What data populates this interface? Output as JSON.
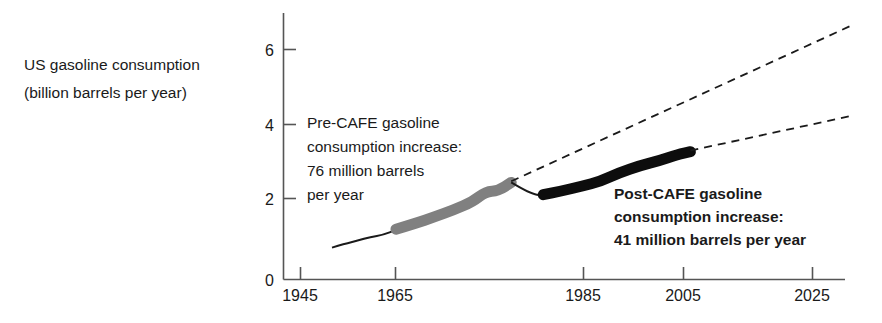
{
  "chart_data": {
    "type": "line",
    "title": "",
    "ylabel_lines": [
      "US gasoline consumption",
      "(billion barrels per year)"
    ],
    "ylabel": "US gasoline consumption (billion barrels per year)",
    "xlabel": "",
    "xlim": [
      1941,
      2033
    ],
    "ylim": [
      0,
      6.8
    ],
    "grid": false,
    "legend_position": "none",
    "x_ticks": [
      1945,
      1965,
      1985,
      2005,
      2025
    ],
    "y_ticks": [
      0,
      2,
      4,
      6
    ],
    "units": {
      "y": "billion barrels per year",
      "x": "year"
    },
    "series": [
      {
        "name": "Historical consumption (thin, pre-1954)",
        "style": "solid-thin",
        "color": "#1a1a1a",
        "x": [
          1950,
          1952,
          1954,
          1956,
          1958,
          1960
        ],
        "values": [
          0.82,
          0.92,
          1.0,
          1.1,
          1.15,
          1.28
        ]
      },
      {
        "name": "Pre-CAFE consumption trend (thick grey)",
        "style": "solid-thick",
        "color": "#808080",
        "x": [
          1960,
          1963,
          1966,
          1969,
          1972,
          1974,
          1976,
          1978
        ],
        "values": [
          1.3,
          1.45,
          1.62,
          1.8,
          2.02,
          2.28,
          2.3,
          2.52
        ]
      },
      {
        "name": "Transition dip 1978-1983",
        "style": "solid-thin",
        "color": "#1a1a1a",
        "x": [
          1978,
          1981,
          1983
        ],
        "values": [
          2.52,
          2.22,
          2.18
        ]
      },
      {
        "name": "Post-CAFE consumption trend (thick black)",
        "style": "solid-thick",
        "color": "#0d0d0d",
        "x": [
          1983,
          1986,
          1989,
          1992,
          1995,
          1998,
          2001,
          2004,
          2006
        ],
        "values": [
          2.2,
          2.3,
          2.42,
          2.55,
          2.78,
          2.95,
          3.08,
          3.25,
          3.32
        ]
      },
      {
        "name": "Pre-CAFE extrapolation (dashed)",
        "style": "dashed",
        "color": "#1a1a1a",
        "x": [
          1978,
          2031
        ],
        "values": [
          2.55,
          6.6
        ]
      },
      {
        "name": "Post-CAFE extrapolation (dashed)",
        "style": "dashed",
        "color": "#1a1a1a",
        "x": [
          2006,
          2031
        ],
        "values": [
          3.35,
          4.25
        ]
      }
    ],
    "annotations": [
      {
        "name": "pre-cafe-annotation",
        "weight": "regular",
        "lines": [
          "Pre-CAFE gasoline",
          "consumption increase:",
          "76 million barrels",
          "per year"
        ],
        "rate_value": 76,
        "rate_units": "million barrels per year"
      },
      {
        "name": "post-cafe-annotation",
        "weight": "bold",
        "lines": [
          "Post-CAFE gasoline",
          "consumption increase:",
          "41 million barrels per year"
        ],
        "rate_value": 41,
        "rate_units": "million barrels per year"
      }
    ]
  },
  "colors": {
    "background": "#ffffff",
    "axis": "#555555",
    "text": "#1a1a1a",
    "pre_cafe_line": "#808080",
    "post_cafe_line": "#0d0d0d"
  },
  "geometry": {
    "axis_x": 283,
    "axis_top": 13,
    "axis_bottom": 279,
    "axis_right": 845,
    "x_tick_px": [
      300,
      395,
      583,
      683,
      812
    ],
    "y_tick_px": [
      279,
      198,
      124,
      49
    ]
  }
}
